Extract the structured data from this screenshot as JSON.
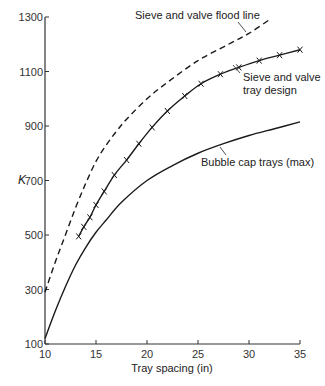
{
  "chart_data": {
    "type": "line",
    "title": "",
    "xlabel": "Tray spacing (in)",
    "ylabel": "K",
    "xlim": [
      10,
      35
    ],
    "ylim": [
      100,
      1300
    ],
    "xticks": [
      10,
      15,
      20,
      25,
      30,
      35
    ],
    "yticks": [
      100,
      300,
      500,
      700,
      900,
      1100,
      1300
    ],
    "grid": false,
    "legend": "none (curves labelled inline with annotations)",
    "series": [
      {
        "name": "Sieve and valve flood line",
        "style": "dashed",
        "x": [
          10,
          11,
          12,
          13,
          14,
          15,
          16,
          17,
          18,
          20,
          22,
          25,
          28,
          30,
          32
        ],
        "values": [
          290,
          400,
          500,
          600,
          690,
          770,
          830,
          880,
          925,
          1000,
          1060,
          1140,
          1200,
          1240,
          1290
        ]
      },
      {
        "name": "Sieve and valve tray design",
        "style": "solid with x markers",
        "x": [
          13.3,
          13.8,
          14.4,
          15.0,
          15.8,
          16.8,
          18.0,
          19.2,
          20.5,
          22.0,
          23.7,
          25.3,
          27.2,
          29.0,
          31.0,
          33.0,
          35.0
        ],
        "values": [
          495,
          530,
          565,
          610,
          660,
          720,
          775,
          835,
          895,
          955,
          1010,
          1055,
          1090,
          1115,
          1140,
          1160,
          1180
        ]
      },
      {
        "name": "Bubble cap trays (max)",
        "style": "solid",
        "x": [
          10,
          11,
          12,
          13,
          14,
          15,
          16,
          17.5,
          20,
          22.5,
          25,
          27.5,
          30,
          32.5,
          35
        ],
        "values": [
          120,
          220,
          310,
          390,
          455,
          510,
          555,
          620,
          700,
          755,
          800,
          835,
          865,
          890,
          915
        ]
      }
    ],
    "annotations": [
      {
        "text": "Sieve and valve flood line",
        "points_to": "Sieve and valve flood line"
      },
      {
        "text": "Sieve and valve tray design",
        "points_to": "Sieve and valve tray design"
      },
      {
        "text": "Bubble cap trays (max)",
        "points_to": "Bubble cap trays (max)"
      }
    ]
  },
  "labels": {
    "xlabel": "Tray spacing (in)",
    "ylabel": "K",
    "flood": "Sieve and valve flood line",
    "design_1": "Sieve and valve",
    "design_2": "tray design",
    "bubble": "Bubble cap trays (max)"
  }
}
